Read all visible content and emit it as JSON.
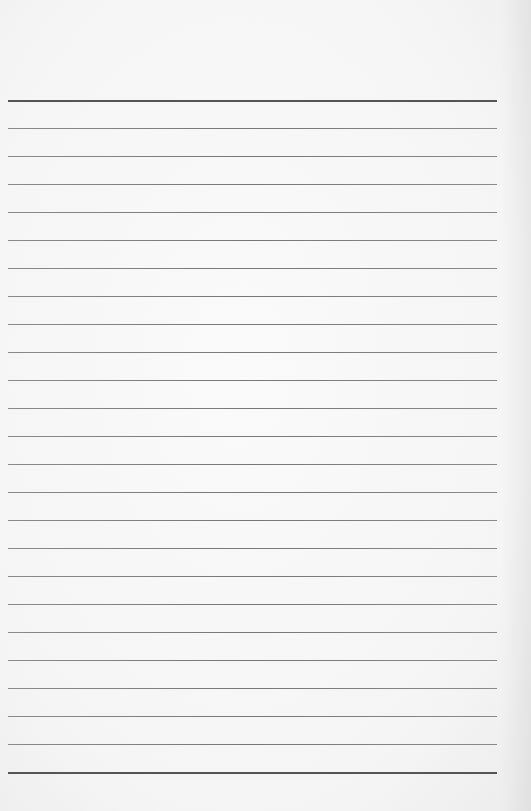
{
  "page": {
    "type": "lined-paper",
    "background_color": "#f7f7f7",
    "line_color": "#7a7a7a",
    "line_count": 25,
    "first_line_y": 100,
    "line_spacing": 28,
    "line_left": 8,
    "line_width": 489
  }
}
